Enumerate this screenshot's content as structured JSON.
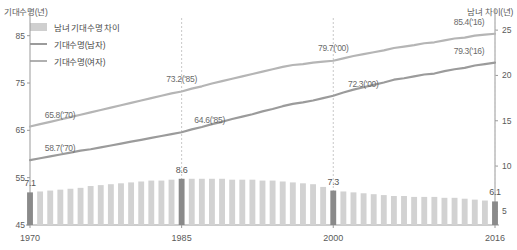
{
  "axes": {
    "y_left_title": "기대수명(년)",
    "y_right_title": "남녀 차이(년)",
    "y_left_ticks": [
      "85",
      "75",
      "65",
      "55",
      "45"
    ],
    "y_right_ticks": [
      "25",
      "20",
      "15",
      "10",
      "5"
    ],
    "x_ticks": [
      "1970",
      "1985",
      "2000",
      "2016"
    ]
  },
  "legend": {
    "items": [
      {
        "label": "남녀 기대수명 차이",
        "type": "bar",
        "color": "#cfcfcf"
      },
      {
        "label": "기대수명(남자)",
        "type": "line",
        "color": "#9b9b9b"
      },
      {
        "label": "기대수명(여자)",
        "type": "line",
        "color": "#b0b0b0"
      }
    ]
  },
  "callouts": {
    "female": [
      {
        "text": "65.8('70)",
        "year": 1970
      },
      {
        "text": "73.2('85)",
        "year": 1985
      },
      {
        "text": "79.7('00)",
        "year": 2000
      },
      {
        "text": "85.4('16)",
        "year": 2016
      }
    ],
    "male": [
      {
        "text": "58.7('70)",
        "year": 1970
      },
      {
        "text": "64.6('85)",
        "year": 1985
      },
      {
        "text": "72.3('00)",
        "year": 2000
      },
      {
        "text": "79.3('16)",
        "year": 2016
      }
    ],
    "gap": [
      {
        "text": "7.1",
        "year": 1970
      },
      {
        "text": "8.6",
        "year": 1985
      },
      {
        "text": "7.3",
        "year": 2000
      },
      {
        "text": "6.1",
        "year": 2016
      }
    ]
  },
  "chart_data": {
    "type": "bar",
    "title": "",
    "xlabel": "",
    "ylabel": "기대수명(년)",
    "ylabel_secondary": "남녀 차이(년)",
    "ylim": [
      45,
      90
    ],
    "ylim_secondary": [
      3.5,
      27
    ],
    "grid": "vertical-dashed-at-1985-2000-2016",
    "legend_position": "top-left",
    "x": [
      1970,
      1971,
      1972,
      1973,
      1974,
      1975,
      1976,
      1977,
      1978,
      1979,
      1980,
      1981,
      1982,
      1983,
      1984,
      1985,
      1986,
      1987,
      1988,
      1989,
      1990,
      1991,
      1992,
      1993,
      1994,
      1995,
      1996,
      1997,
      1998,
      1999,
      2000,
      2001,
      2002,
      2003,
      2004,
      2005,
      2006,
      2007,
      2008,
      2009,
      2010,
      2011,
      2012,
      2013,
      2014,
      2015,
      2016
    ],
    "series": [
      {
        "name": "남녀 기대수명 차이",
        "type": "bar",
        "axis": "right",
        "color": "#d2d2d2",
        "highlight_color": "#8a8a8a",
        "highlight_years": [
          1970,
          1985,
          2000,
          2016
        ],
        "values": [
          7.1,
          7.2,
          7.3,
          7.4,
          7.5,
          7.6,
          7.8,
          7.9,
          8.0,
          8.1,
          8.2,
          8.3,
          8.4,
          8.4,
          8.5,
          8.6,
          8.6,
          8.6,
          8.6,
          8.6,
          8.5,
          8.5,
          8.5,
          8.4,
          8.4,
          8.3,
          8.2,
          8.1,
          8.0,
          7.7,
          7.3,
          7.2,
          7.1,
          7.0,
          6.9,
          6.8,
          6.7,
          6.7,
          6.6,
          6.6,
          6.6,
          6.5,
          6.5,
          6.4,
          6.3,
          6.2,
          6.1
        ]
      },
      {
        "name": "기대수명(여자)",
        "type": "line",
        "axis": "left",
        "color": "#b5b5b5",
        "values": [
          65.8,
          66.3,
          66.8,
          67.3,
          67.8,
          68.3,
          68.8,
          69.3,
          69.8,
          70.3,
          70.8,
          71.3,
          71.8,
          72.3,
          72.8,
          73.2,
          73.8,
          74.3,
          74.9,
          75.4,
          75.9,
          76.4,
          76.9,
          77.4,
          77.9,
          78.4,
          78.8,
          79.0,
          79.3,
          79.5,
          79.7,
          80.2,
          80.7,
          81.1,
          81.5,
          81.9,
          82.4,
          82.7,
          83.0,
          83.4,
          83.6,
          84.0,
          84.4,
          84.6,
          85.0,
          85.2,
          85.4
        ]
      },
      {
        "name": "기대수명(남자)",
        "type": "line",
        "axis": "left",
        "color": "#9b9b9b",
        "values": [
          58.7,
          59.1,
          59.5,
          59.9,
          60.3,
          60.7,
          61.0,
          61.4,
          61.8,
          62.2,
          62.6,
          63.0,
          63.4,
          63.8,
          64.2,
          64.6,
          65.2,
          65.7,
          66.3,
          66.8,
          67.4,
          67.9,
          68.4,
          69.0,
          69.5,
          70.1,
          70.6,
          70.9,
          71.3,
          71.8,
          72.3,
          73.0,
          73.6,
          74.1,
          74.6,
          75.1,
          75.7,
          76.0,
          76.4,
          76.8,
          77.0,
          77.5,
          77.9,
          78.2,
          78.7,
          79.0,
          79.3
        ]
      }
    ]
  },
  "plot_geometry": {
    "left": 30,
    "right": 495,
    "top": 12,
    "bottom": 225
  }
}
